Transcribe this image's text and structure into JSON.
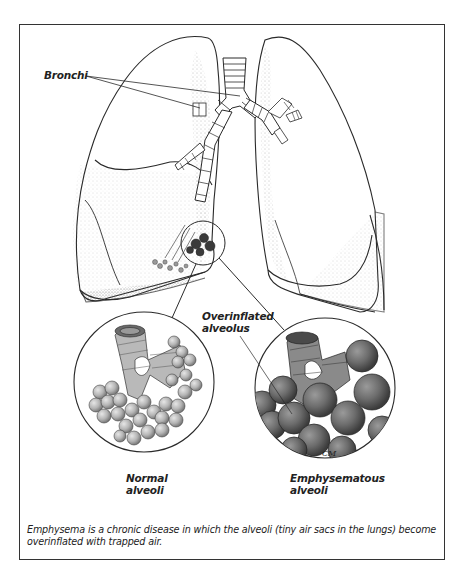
{
  "figure": {
    "labels": {
      "bronchi": "Bronchi",
      "overinflated_line1": "Overinflated",
      "overinflated_line2": "alveolus",
      "normal_line1": "Normal",
      "normal_line2": "alveoli",
      "emphysematous_line1": "Emphysematous",
      "emphysematous_line2": "alveoli"
    },
    "caption": "Emphysema is a chronic disease in which the alveoli (tiny air sacs in the lungs) become overinflated with trapped air.",
    "signature": "CM"
  },
  "colors": {
    "line": "#2a2a2a",
    "stipple": "#8a8a8a",
    "alveoli_normal": "#b8b8b8",
    "alveoli_emphysema": "#6e6e6e",
    "frame": "#333333"
  }
}
